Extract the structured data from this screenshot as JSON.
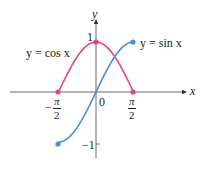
{
  "chart_data": {
    "type": "line",
    "title": "",
    "xlabel": "x",
    "ylabel": "y",
    "xlim": [
      -1.5708,
      1.5708
    ],
    "ylim": [
      -1,
      1
    ],
    "grid": false,
    "x_ticks": [
      "-π/2",
      "0",
      "π/2"
    ],
    "y_ticks": [
      "1",
      "-1"
    ],
    "series": [
      {
        "name": "y = cos x",
        "color": "#e8457a",
        "x": [
          -1.5708,
          -0.7854,
          0,
          0.7854,
          1.5708
        ],
        "values": [
          0,
          0.7071,
          1,
          0.7071,
          0
        ],
        "endpoints": [
          [
            -1.5708,
            0
          ],
          [
            0,
            1
          ],
          [
            1.5708,
            0
          ]
        ]
      },
      {
        "name": "y = sin x",
        "color": "#4a8fd8",
        "x": [
          -1.5708,
          -0.7854,
          0,
          0.7854,
          1.5708
        ],
        "values": [
          -1,
          -0.7071,
          0,
          0.7071,
          1
        ],
        "endpoints": [
          [
            -1.5708,
            -1
          ],
          [
            1.5708,
            1
          ]
        ]
      }
    ]
  },
  "labels": {
    "y_axis": "y",
    "x_axis": "x",
    "origin": "0",
    "y_one": "1",
    "y_neg_one": "−1",
    "neg_sign": "−",
    "pi": "π",
    "two": "2",
    "cos_label": "y = cos x",
    "sin_label": "y = sin x"
  }
}
